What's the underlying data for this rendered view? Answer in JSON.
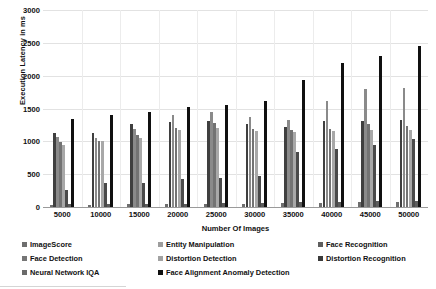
{
  "chart_data": {
    "type": "bar",
    "title": "",
    "xlabel": "Number Of Images",
    "ylabel": "Execution Latency in ms",
    "ylim": [
      0,
      3000
    ],
    "ytick_step": 500,
    "yticks": [
      3000,
      2500,
      2000,
      1500,
      1000,
      500,
      0
    ],
    "grid": true,
    "legend_position": "bottom",
    "categories": [
      "5000",
      "10000",
      "15000",
      "20000",
      "25000",
      "30000",
      "35000",
      "40000",
      "45000",
      "50000"
    ],
    "series": [
      {
        "name": "ImageScore",
        "color": "#6e6e6e",
        "values": [
          30,
          28,
          40,
          45,
          48,
          52,
          60,
          62,
          72,
          80
        ]
      },
      {
        "name": "Entity Manipulation",
        "color": "#3f3f3f",
        "values": [
          1130,
          1120,
          1260,
          1300,
          1310,
          1260,
          1220,
          1310,
          1310,
          1330
        ]
      },
      {
        "name": "Face Recognition",
        "color": "#8a8a8a",
        "values": [
          1060,
          1050,
          1190,
          1400,
          1450,
          1370,
          1330,
          1620,
          1800,
          1810
        ]
      },
      {
        "name": "Face Detection",
        "color": "#737373",
        "values": [
          990,
          1010,
          1090,
          1200,
          1280,
          1190,
          1180,
          1190,
          1260,
          1240
        ]
      },
      {
        "name": "Distortion Detection",
        "color": "#a8a8a8",
        "values": [
          940,
          1000,
          1050,
          1180,
          1210,
          1160,
          1140,
          1150,
          1180,
          1180
        ]
      },
      {
        "name": "Distortion Recognition",
        "color": "#4a4a4a",
        "values": [
          265,
          370,
          360,
          420,
          440,
          470,
          840,
          880,
          950,
          1040
        ]
      },
      {
        "name": "Neural Network IQA",
        "color": "#5c5c5c",
        "values": [
          40,
          40,
          45,
          50,
          55,
          60,
          70,
          75,
          85,
          95
        ]
      },
      {
        "name": "Face Alignment Anomaly Detection",
        "color": "#101010",
        "values": [
          1340,
          1400,
          1450,
          1520,
          1560,
          1620,
          1940,
          2190,
          2300,
          2450
        ]
      }
    ]
  },
  "legend": {
    "items": [
      {
        "label": "ImageScore",
        "color": "#6e6e6e",
        "col": 0,
        "row": 0
      },
      {
        "label": "Entity Manipulation",
        "color": "#9d9d9d",
        "col": 1,
        "row": 0
      },
      {
        "label": "Face Recognition",
        "color": "#5e5e5e",
        "col": 2,
        "row": 0
      },
      {
        "label": "Face Detection",
        "color": "#767676",
        "col": 0,
        "row": 1
      },
      {
        "label": "Distortion Detection",
        "color": "#a2a2a2",
        "col": 1,
        "row": 1
      },
      {
        "label": "Distortion Recognition",
        "color": "#3a3a3a",
        "col": 2,
        "row": 1
      },
      {
        "label": "Neural Network IQA",
        "color": "#6a6a6a",
        "col": 0,
        "row": 2
      },
      {
        "label": "Face Alignment Anomaly Detection",
        "color": "#101010",
        "col": 1,
        "row": 2
      }
    ]
  }
}
